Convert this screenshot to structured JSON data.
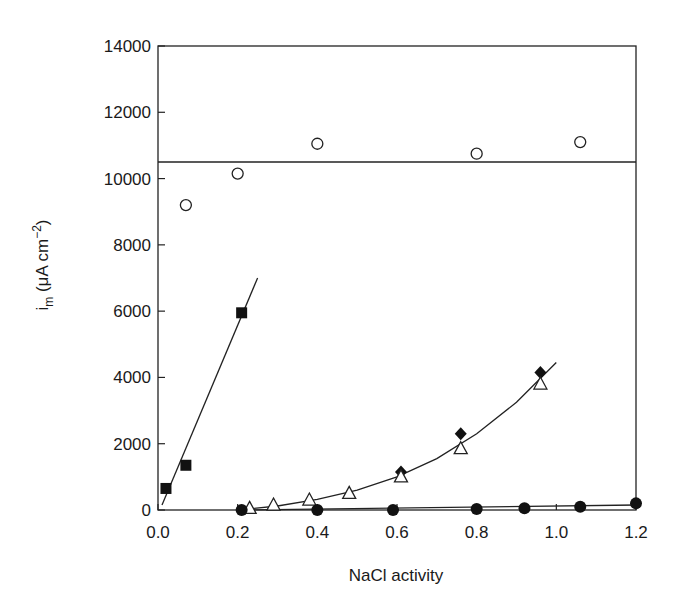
{
  "chart_data": {
    "type": "scatter",
    "title": "",
    "xlabel": "NaCl activity",
    "ylabel": "i_m (μA cm^-2)",
    "ylabel_parts": {
      "main": "i",
      "sub": "m",
      "unit": " (μA cm",
      "sup": "−2",
      "close": ")"
    },
    "xlim": [
      0.0,
      1.2
    ],
    "ylim": [
      0,
      14000
    ],
    "xticks": [
      0.0,
      0.2,
      0.4,
      0.6,
      0.8,
      1.0,
      1.2
    ],
    "xtick_labels": [
      "0.0",
      "0.2",
      "0.4",
      "0.6",
      "0.8",
      "1.0",
      "1.2"
    ],
    "yticks": [
      0,
      2000,
      4000,
      6000,
      8000,
      10000,
      12000,
      14000
    ],
    "ytick_labels": [
      "0",
      "2000",
      "4000",
      "6000",
      "8000",
      "10000",
      "12000",
      "14000"
    ],
    "grid": false,
    "legend": null,
    "series": [
      {
        "name": "open-circles",
        "marker": "open-circle",
        "x": [
          0.07,
          0.2,
          0.4,
          0.8,
          1.06
        ],
        "y": [
          9200,
          10150,
          11050,
          10750,
          11100
        ],
        "fit": {
          "type": "horizontal",
          "y": 10500,
          "x_range": [
            0.0,
            1.2
          ]
        }
      },
      {
        "name": "filled-squares",
        "marker": "filled-square",
        "x": [
          0.02,
          0.07,
          0.21
        ],
        "y": [
          650,
          1350,
          5950
        ],
        "fit": {
          "type": "linear",
          "points": [
            [
              0.01,
              150
            ],
            [
              0.25,
              7000
            ]
          ]
        }
      },
      {
        "name": "filled-diamonds",
        "marker": "filled-diamond",
        "x": [
          0.61,
          0.76,
          0.96
        ],
        "y": [
          1150,
          2300,
          4150
        ]
      },
      {
        "name": "open-triangles",
        "marker": "open-triangle",
        "x": [
          0.23,
          0.29,
          0.38,
          0.48,
          0.61,
          0.76,
          0.96
        ],
        "y": [
          50,
          150,
          300,
          500,
          1000,
          1850,
          3800
        ],
        "fit": {
          "type": "curve",
          "points": [
            [
              0.2,
              0
            ],
            [
              0.3,
              120
            ],
            [
              0.4,
              320
            ],
            [
              0.5,
              600
            ],
            [
              0.6,
              1000
            ],
            [
              0.7,
              1550
            ],
            [
              0.8,
              2300
            ],
            [
              0.9,
              3250
            ],
            [
              1.0,
              4450
            ]
          ]
        }
      },
      {
        "name": "filled-circles",
        "marker": "filled-circle",
        "x": [
          0.21,
          0.4,
          0.59,
          0.8,
          0.92,
          1.06,
          1.2
        ],
        "y": [
          0,
          0,
          0,
          30,
          50,
          100,
          200
        ],
        "fit": {
          "type": "linear",
          "points": [
            [
              0.2,
              0
            ],
            [
              1.2,
              150
            ]
          ]
        }
      }
    ]
  }
}
